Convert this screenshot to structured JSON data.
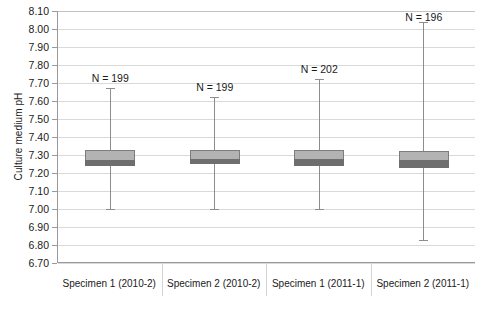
{
  "chart_data": {
    "type": "box",
    "title": "",
    "xlabel": "",
    "ylabel": "Culture medium pH",
    "ylim": [
      6.7,
      8.1
    ],
    "ytick_step": 0.1,
    "yticks": [
      "8.10",
      "8.00",
      "7.90",
      "7.80",
      "7.70",
      "7.60",
      "7.50",
      "7.40",
      "7.30",
      "7.20",
      "7.10",
      "7.00",
      "6.90",
      "6.80",
      "6.70"
    ],
    "grid": true,
    "legend": "none",
    "categories": [
      "Specimen 1 (2010-2)",
      "Specimen 2 (2010-2)",
      "Specimen 1 (2011-1)",
      "Specimen 2 (2011-1)"
    ],
    "annotations": [
      "N = 199",
      "N = 199",
      "N = 202",
      "N = 196"
    ],
    "boxes": [
      {
        "category": "Specimen 1 (2010-2)",
        "n_label": "N = 199",
        "n": 199,
        "whisker_high": 7.67,
        "q3": 7.33,
        "median": 7.27,
        "q1": 7.24,
        "whisker_low": 7.0
      },
      {
        "category": "Specimen 2 (2010-2)",
        "n_label": "N = 199",
        "n": 199,
        "whisker_high": 7.62,
        "q3": 7.33,
        "median": 7.28,
        "q1": 7.25,
        "whisker_low": 7.0
      },
      {
        "category": "Specimen 1 (2011-1)",
        "n_label": "N = 202",
        "n": 202,
        "whisker_high": 7.72,
        "q3": 7.33,
        "median": 7.28,
        "q1": 7.24,
        "whisker_low": 7.0
      },
      {
        "category": "Specimen 2 (2011-1)",
        "n_label": "N = 196",
        "n": 196,
        "whisker_high": 8.04,
        "q3": 7.32,
        "median": 7.27,
        "q1": 7.23,
        "whisker_low": 6.83
      }
    ],
    "colors": {
      "box_fill": "#b3b3b3",
      "box_border": "#7d7d7d",
      "median_fill": "#6e6e6e",
      "whisker": "#8d8d8d",
      "gridline": "#d9d9d9",
      "axis": "#9a9a9a",
      "text": "#1a1a1a",
      "background": "#ffffff"
    }
  }
}
